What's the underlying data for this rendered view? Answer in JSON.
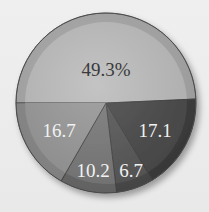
{
  "chart_data": {
    "type": "pie",
    "title": "",
    "start_angle_deg": 180,
    "direction": "clockwise",
    "slices": [
      {
        "label": "49.3%",
        "value": 49.3,
        "color": "#bdbdbd",
        "rim": "#a9a9a9",
        "text_color": "#3a3a3a",
        "label_pos": [
          106,
          72
        ]
      },
      {
        "label": "17.1",
        "value": 17.1,
        "color": "#4a4a4a",
        "rim": "#3c3c3c",
        "text_color": "#f2f2f2",
        "label_pos": [
          155,
          133
        ]
      },
      {
        "label": "6.7",
        "value": 6.7,
        "color": "#585858",
        "rim": "#4a4a4a",
        "text_color": "#f2f2f2",
        "label_pos": [
          131,
          173
        ]
      },
      {
        "label": "10.2",
        "value": 10.2,
        "color": "#7a7a7a",
        "rim": "#6a6a6a",
        "text_color": "#f2f2f2",
        "label_pos": [
          93,
          173
        ]
      },
      {
        "label": "16.7",
        "value": 16.7,
        "color": "#999999",
        "rim": "#8a8a8a",
        "text_color": "#f2f2f2",
        "label_pos": [
          59,
          133
        ]
      }
    ],
    "values": [
      49.3,
      17.1,
      6.7,
      10.2,
      16.7
    ],
    "categories": [
      "49.3%",
      "17.1",
      "6.7",
      "10.2",
      "16.7"
    ],
    "legend": "none",
    "units": "percent"
  },
  "layout": {
    "cx": 106,
    "cy": 103,
    "r": 90,
    "rim_width": 9
  }
}
